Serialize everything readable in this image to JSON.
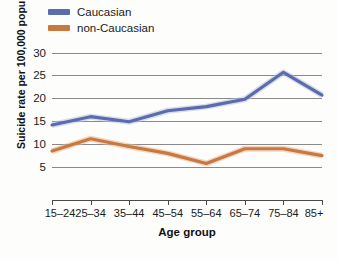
{
  "chart_data": {
    "type": "line",
    "title": "",
    "xlabel": "Age group",
    "ylabel": "Suicide rate per 100,000 population",
    "categories": [
      "15–24",
      "25–34",
      "35–44",
      "45–54",
      "55–64",
      "65–74",
      "75–84",
      "85+"
    ],
    "ylim": [
      0,
      31
    ],
    "yticks": [
      5,
      10,
      15,
      20,
      25,
      30
    ],
    "ytick_labels": [
      "5",
      "10",
      "15",
      "20",
      "25",
      "30"
    ],
    "grid": "horizontal",
    "legend_position": "top-left",
    "series": [
      {
        "name": "Caucasian",
        "color": "#5b6bad",
        "values": [
          14.2,
          16.0,
          14.9,
          17.3,
          18.2,
          19.8,
          25.7,
          20.7
        ]
      },
      {
        "name": "non-Caucasian",
        "color": "#c9783f",
        "values": [
          8.5,
          11.2,
          9.5,
          8.0,
          5.8,
          9.0,
          9.0,
          7.5
        ]
      }
    ]
  },
  "colors": {
    "caucasian": "#5b6bad",
    "non_caucasian": "#c9783f",
    "gridline": "#8a8a8a",
    "axis": "#4a4a4a",
    "text": "#1a1a1a",
    "background": "#fdfdfc"
  }
}
